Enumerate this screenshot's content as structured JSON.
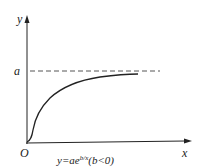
{
  "figure": {
    "axis_labels": {
      "y": "y",
      "x": "x",
      "origin": "O"
    },
    "asymptote_label": "a",
    "caption": {
      "lhs": "y=ae",
      "exponent": "b/x",
      "condition": "(b<0)"
    },
    "colors": {
      "stroke": "#222222",
      "dash": "#555555",
      "background": "#ffffff"
    }
  }
}
